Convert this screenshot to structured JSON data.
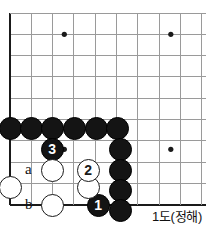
{
  "figure": {
    "caption": "1도(정해)",
    "board": {
      "origin_x": 10,
      "origin_y": 13,
      "spacing": 21.3,
      "cols": 10,
      "rows": 10,
      "edge_color": "#1a1a1a",
      "grid_color": "#9a9a9a",
      "bottom_edge_row": 9,
      "left_edge_col": 0
    },
    "star_points": [
      {
        "col": 2.55,
        "row": 1.0
      },
      {
        "col": 7.55,
        "row": 1.0
      },
      {
        "col": 2.55,
        "row": 6.4
      },
      {
        "col": 7.55,
        "row": 6.4
      }
    ],
    "stones": [
      {
        "color": "black",
        "label": "",
        "x": 10,
        "y": 128,
        "r": 11.5
      },
      {
        "color": "black",
        "label": "",
        "x": 31,
        "y": 128,
        "r": 11.5
      },
      {
        "color": "black",
        "label": "",
        "x": 52,
        "y": 128,
        "r": 11.5
      },
      {
        "color": "black",
        "label": "",
        "x": 74,
        "y": 128,
        "r": 11.5
      },
      {
        "color": "black",
        "label": "",
        "x": 96,
        "y": 128,
        "r": 11.5
      },
      {
        "color": "black",
        "label": "",
        "x": 117,
        "y": 128,
        "r": 11.5
      },
      {
        "color": "black",
        "label": "",
        "x": 120,
        "y": 149,
        "r": 11.5
      },
      {
        "color": "black",
        "label": "",
        "x": 120,
        "y": 170,
        "r": 11.5
      },
      {
        "color": "black",
        "label": "",
        "x": 120,
        "y": 190,
        "r": 11.5
      },
      {
        "color": "black",
        "label": "",
        "x": 120,
        "y": 210,
        "r": 11.5
      },
      {
        "color": "black",
        "label": "3",
        "x": 52,
        "y": 149,
        "r": 11.5
      },
      {
        "color": "black",
        "label": "1",
        "x": 98,
        "y": 205,
        "r": 11.5
      },
      {
        "color": "white",
        "label": "",
        "x": 10,
        "y": 187,
        "r": 11.5
      },
      {
        "color": "white",
        "label": "",
        "x": 52,
        "y": 170,
        "r": 11.5
      },
      {
        "color": "white",
        "label": "",
        "x": 52,
        "y": 205,
        "r": 11.5
      },
      {
        "color": "white",
        "label": "",
        "x": 88,
        "y": 187,
        "r": 11.5
      },
      {
        "color": "white",
        "label": "2",
        "x": 88,
        "y": 170,
        "r": 11.5
      }
    ],
    "point_labels": [
      {
        "text": "a",
        "x": 29,
        "y": 170
      },
      {
        "text": "b",
        "x": 29,
        "y": 205
      }
    ]
  }
}
